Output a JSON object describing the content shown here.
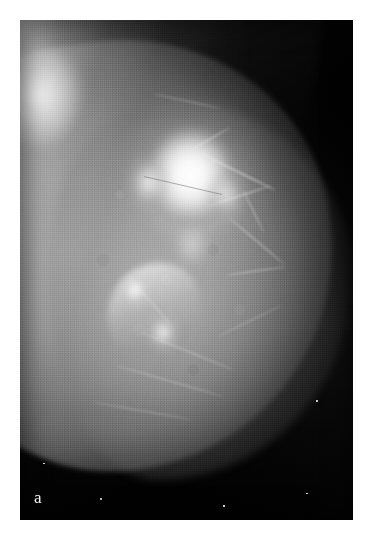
{
  "figure": {
    "panel_label": "a",
    "modality": "mammogram",
    "view": "medio-lateral oblique",
    "caption": "",
    "background_color": "#ffffff",
    "plate": {
      "film_black": "#0a0a0a",
      "tissue_gray": "#b4b4b4",
      "highlight_white": "#ffffff",
      "left_px": 20,
      "top_px": 20,
      "width_px": 333,
      "height_px": 500
    },
    "findings": [
      {
        "name": "dominant-dense-mass",
        "description": "ill-defined high-density spiculated mass, upper central breast",
        "center_pct": {
          "x": 51,
          "y": 31
        }
      },
      {
        "name": "secondary-density",
        "description": "linear branching high-density band inferior-medial to the main mass",
        "center_pct": {
          "x": 40,
          "y": 58
        }
      },
      {
        "name": "pectoral-band",
        "description": "bright pectoral muscle / chest wall along the superior-left margin",
        "center_pct": {
          "x": 6,
          "y": 12
        }
      }
    ],
    "specks": [
      {
        "name": "film-speck-1",
        "x_pct": 24,
        "y_pct": 95.5,
        "size_px": 2
      },
      {
        "name": "film-speck-2",
        "x_pct": 86,
        "y_pct": 94.5,
        "size_px": 1.5
      },
      {
        "name": "film-speck-3",
        "x_pct": 7,
        "y_pct": 88.5,
        "size_px": 1.5
      },
      {
        "name": "film-speck-4",
        "x_pct": 89,
        "y_pct": 76.0,
        "size_px": 1.5
      },
      {
        "name": "film-speck-5",
        "x_pct": 61,
        "y_pct": 97.0,
        "size_px": 1.5
      }
    ]
  }
}
